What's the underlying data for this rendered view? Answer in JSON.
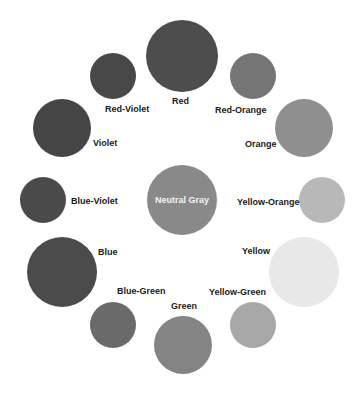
{
  "diagram": {
    "center": {
      "label": "Neutral Gray",
      "color": "#898989",
      "cx": 182,
      "cy": 200,
      "r": 35
    },
    "swatches": [
      {
        "label": "Red",
        "color": "#4d4d4d",
        "cx": 182,
        "cy": 56,
        "r": 36,
        "lx": 172,
        "ly": 96
      },
      {
        "label": "Red-Orange",
        "color": "#757575",
        "cx": 253,
        "cy": 76,
        "r": 23,
        "lx": 215,
        "ly": 105
      },
      {
        "label": "Orange",
        "color": "#8f8f8f",
        "cx": 304,
        "cy": 128,
        "r": 29,
        "lx": 245,
        "ly": 139
      },
      {
        "label": "Yellow-Orange",
        "color": "#b8b8b8",
        "cx": 322,
        "cy": 200,
        "r": 23,
        "lx": 237,
        "ly": 197
      },
      {
        "label": "Yellow",
        "color": "#e8e8e8",
        "cx": 304,
        "cy": 272,
        "r": 35,
        "lx": 242,
        "ly": 246
      },
      {
        "label": "Yellow-Green",
        "color": "#a8a8a8",
        "cx": 253,
        "cy": 325,
        "r": 23,
        "lx": 209,
        "ly": 287
      },
      {
        "label": "Green",
        "color": "#848484",
        "cx": 183,
        "cy": 345,
        "r": 29,
        "lx": 171,
        "ly": 301
      },
      {
        "label": "Blue-Green",
        "color": "#6a6a6a",
        "cx": 113,
        "cy": 325,
        "r": 23,
        "lx": 117,
        "ly": 286
      },
      {
        "label": "Blue",
        "color": "#4b4b4b",
        "cx": 62,
        "cy": 272,
        "r": 35,
        "lx": 98,
        "ly": 247
      },
      {
        "label": "Blue-Violet",
        "color": "#4a4a4a",
        "cx": 43,
        "cy": 200,
        "r": 23,
        "lx": 71,
        "ly": 196
      },
      {
        "label": "Violet",
        "color": "#454545",
        "cx": 62,
        "cy": 128,
        "r": 29,
        "lx": 93,
        "ly": 138
      },
      {
        "label": "Red-Violet",
        "color": "#484848",
        "cx": 113,
        "cy": 76,
        "r": 23,
        "lx": 105,
        "ly": 104
      }
    ]
  }
}
